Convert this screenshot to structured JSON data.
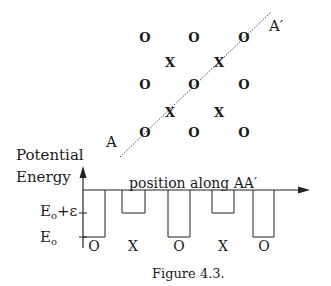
{
  "lattice": {
    "o_sites": [
      {
        "x": 145,
        "y": 37,
        "label": "O"
      },
      {
        "x": 194,
        "y": 37,
        "label": "O"
      },
      {
        "x": 244,
        "y": 37,
        "label": "O"
      },
      {
        "x": 145,
        "y": 84,
        "label": "O"
      },
      {
        "x": 194,
        "y": 84,
        "label": "O"
      },
      {
        "x": 244,
        "y": 84,
        "label": "O"
      },
      {
        "x": 145,
        "y": 132,
        "label": "O"
      },
      {
        "x": 194,
        "y": 132,
        "label": "O"
      },
      {
        "x": 244,
        "y": 132,
        "label": "O"
      }
    ],
    "x_sites": [
      {
        "x": 170,
        "y": 62,
        "label": "X"
      },
      {
        "x": 219,
        "y": 62,
        "label": "X"
      },
      {
        "x": 170,
        "y": 112,
        "label": "X"
      },
      {
        "x": 219,
        "y": 112,
        "label": "X"
      }
    ],
    "line_start_label": "A",
    "line_end_label": "A′"
  },
  "plot": {
    "y_axis_title_line1": "Potential",
    "y_axis_title_line2": "Energy",
    "x_axis_title": "position along AA′",
    "level_high": {
      "base": "E",
      "sub": "o",
      "suffix": "+ε"
    },
    "level_low": {
      "base": "E",
      "sub": "o"
    },
    "wells": [
      {
        "site": "O",
        "depth": "Eo"
      },
      {
        "site": "X",
        "depth": "Eo+ε"
      },
      {
        "site": "O",
        "depth": "Eo"
      },
      {
        "site": "X",
        "depth": "Eo+ε"
      },
      {
        "site": "O",
        "depth": "Eo"
      }
    ]
  },
  "caption": "Figure 4.3."
}
